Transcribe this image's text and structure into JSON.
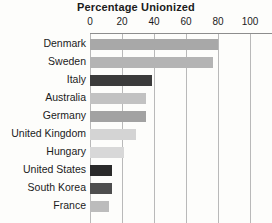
{
  "chart_data": {
    "type": "bar",
    "orientation": "horizontal",
    "title": "Percentage Unionized",
    "xlabel": "",
    "ylabel": "",
    "xlim": [
      0,
      100
    ],
    "xticks": [
      0,
      20,
      40,
      60,
      80,
      100
    ],
    "xtick_labels": [
      "0",
      "20",
      "40",
      "60",
      "80",
      "100"
    ],
    "grid": true,
    "grid_axis": "x",
    "legend": false,
    "categories": [
      "Denmark",
      "Sweden",
      "Italy",
      "Australia",
      "Germany",
      "United Kingdom",
      "Hungary",
      "United States",
      "South Korea",
      "France"
    ],
    "values": [
      80,
      77,
      39,
      35,
      35,
      29,
      21,
      14,
      14,
      12
    ],
    "bar_colors": [
      "#a8a8a8",
      "#b4b4b4",
      "#3b3b3b",
      "#c2c2c2",
      "#a2a2a2",
      "#d4d4d4",
      "#d8d8d8",
      "#2a2a2a",
      "#4e4e4e",
      "#bcbcbc"
    ]
  },
  "figure": {
    "background_color": "#fdfdfb",
    "axis_color": "#8d8d8d",
    "grid_color": "#b9b9b9",
    "text_color": "#1b1b1b"
  }
}
